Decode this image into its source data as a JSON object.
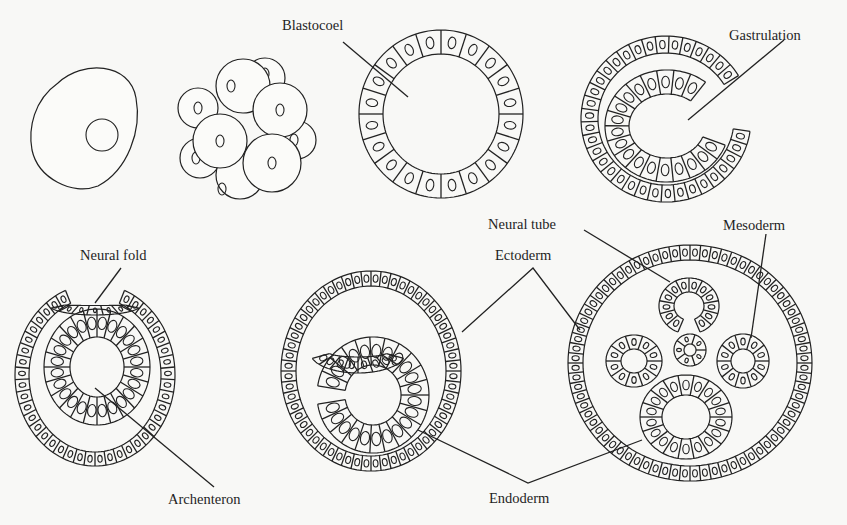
{
  "diagram": {
    "colors": {
      "background": "#f8f8f6",
      "ink": "#222222"
    },
    "stages": [
      {
        "id": "zygote",
        "name": "Fertilized egg"
      },
      {
        "id": "morula",
        "name": "Cleavage / morula"
      },
      {
        "id": "blastula",
        "name": "Blastula"
      },
      {
        "id": "gastrula",
        "name": "Gastrula"
      },
      {
        "id": "neurula",
        "name": "Neurula"
      },
      {
        "id": "neural-tube-forming",
        "name": "Neural tube forming"
      },
      {
        "id": "three-germ-layers",
        "name": "Three germ layers"
      }
    ],
    "labels": {
      "blastocoel": "Blastocoel",
      "gastrulation": "Gastrulation",
      "neural_fold": "Neural fold",
      "archenteron": "Archenteron",
      "neural_tube": "Neural tube",
      "ectoderm": "Ectoderm",
      "mesoderm": "Mesoderm",
      "endoderm": "Endoderm"
    }
  }
}
